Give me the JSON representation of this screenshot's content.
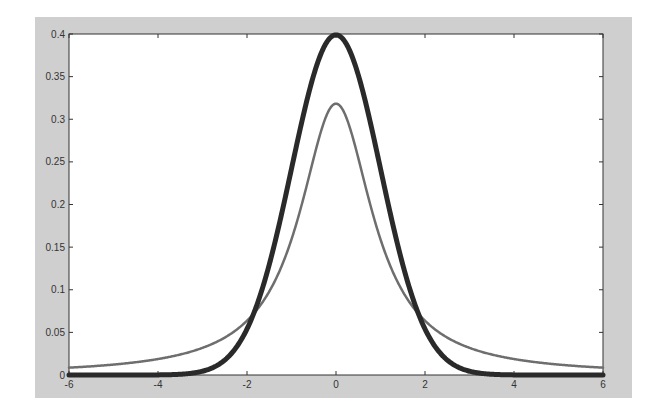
{
  "chart_data": {
    "type": "line",
    "title": "",
    "xlabel": "",
    "ylabel": "",
    "xlim": [
      -6,
      6
    ],
    "ylim": [
      0,
      0.4
    ],
    "grid": false,
    "legend": null,
    "x_ticks": [
      "-6",
      "-4",
      "-2",
      "0",
      "2",
      "4",
      "6"
    ],
    "y_ticks": [
      "0",
      "0.05",
      "0.1",
      "0.15",
      "0.2",
      "0.25",
      "0.3",
      "0.35",
      "0.4"
    ],
    "series": [
      {
        "name": "Normal (thick dark)",
        "color": "#2a2a2a",
        "line_width": 5,
        "x": [
          -6,
          -5,
          -4,
          -3,
          -2.5,
          -2,
          -1.5,
          -1,
          -0.5,
          0,
          0.5,
          1,
          1.5,
          2,
          2.5,
          3,
          4,
          5,
          6
        ],
        "values": [
          0.0,
          0.0,
          0.0001,
          0.0044,
          0.0175,
          0.054,
          0.1295,
          0.242,
          0.3521,
          0.3989,
          0.3521,
          0.242,
          0.1295,
          0.054,
          0.0175,
          0.0044,
          0.0001,
          0.0,
          0.0
        ]
      },
      {
        "name": "Cauchy (thin grey)",
        "color": "#6e6e6e",
        "line_width": 2.5,
        "x": [
          -6,
          -5,
          -4,
          -3,
          -2.5,
          -2,
          -1.5,
          -1,
          -0.5,
          0,
          0.5,
          1,
          1.5,
          2,
          2.5,
          3,
          4,
          5,
          6
        ],
        "values": [
          0.0086,
          0.0122,
          0.0187,
          0.0318,
          0.0439,
          0.0637,
          0.0979,
          0.1592,
          0.2546,
          0.3183,
          0.2546,
          0.1592,
          0.0979,
          0.0637,
          0.0439,
          0.0318,
          0.0187,
          0.0122,
          0.0086
        ]
      }
    ]
  },
  "colors": {
    "figure_background": "#cfcfcf",
    "axes_background": "#ffffff",
    "axis_line": "#333333"
  }
}
